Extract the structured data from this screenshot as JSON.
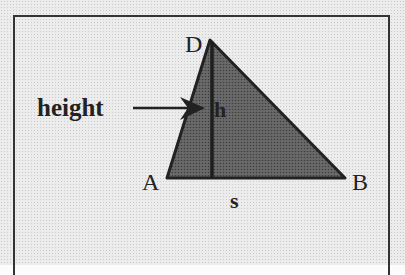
{
  "diagram": {
    "labels": {
      "vertex_a": "A",
      "vertex_b": "B",
      "vertex_d": "D",
      "height_label": "height",
      "height_symbol": "h",
      "base_symbol": "s"
    },
    "colors": {
      "triangle_fill": "#5a5a5a",
      "stroke": "#222222",
      "background": "#ececec"
    },
    "geometry": {
      "A": [
        167,
        178
      ],
      "B": [
        345,
        178
      ],
      "D": [
        210,
        40
      ],
      "foot": [
        212,
        178
      ]
    }
  }
}
